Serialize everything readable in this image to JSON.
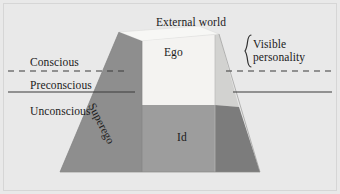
{
  "figure": {
    "background_color": "#e9e9e9",
    "frame_color": "#d6d6d6",
    "text_color": "#1b1b1b"
  },
  "levels": [
    {
      "id": "conscious",
      "label": "Conscious"
    },
    {
      "id": "preconscious",
      "label": "Preconscious"
    },
    {
      "id": "unconscious",
      "label": "Unconscious"
    }
  ],
  "regions": {
    "external_world": {
      "label": "External world",
      "color": "#f2f1ef"
    },
    "ego": {
      "label": "Ego",
      "color": "#f4f3f1"
    },
    "id": {
      "label": "Id",
      "color": "#9d9d9d"
    },
    "superego": {
      "label": "Superego",
      "color": "#8e8e8e"
    },
    "right_upper": {
      "label": "",
      "color": "#d2d2d0"
    },
    "right_lower": {
      "label": "",
      "color": "#7c7c7c"
    },
    "top_face": {
      "label": "",
      "color": "#f7f7f5"
    }
  },
  "annotation": {
    "brace": "}",
    "line1": "Visible",
    "line2": "personality"
  },
  "dividers": {
    "conscious_preconscious": {
      "style": "dashed",
      "color": "#3a3a3a"
    },
    "preconscious_unconscious": {
      "style": "solid",
      "color": "#3a3a3a"
    }
  }
}
